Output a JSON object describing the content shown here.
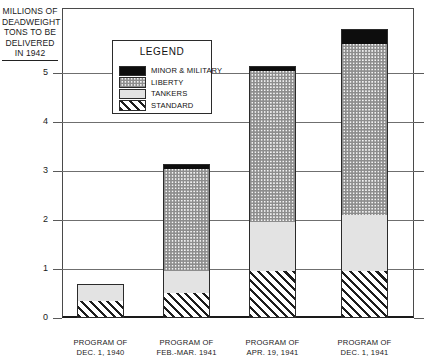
{
  "chart_data": {
    "type": "bar",
    "stacked": true,
    "title": "",
    "subtitle": "",
    "ylabel": "MILLIONS OF DEADWEIGHT TONS TO BE DELIVERED IN 1942",
    "xlabel": "",
    "ylim": [
      0,
      6.3
    ],
    "yticks": [
      0,
      1,
      2,
      3,
      4,
      5
    ],
    "ytick_labels": [
      "0",
      "1",
      "2",
      "3",
      "4",
      "5"
    ],
    "grid": true,
    "legend_position": "inside-top-center",
    "categories": [
      "PROGRAM OF DEC. 1, 1940",
      "PROGRAM OF FEB.-MAR. 1941",
      "PROGRAM OF APR. 19, 1941",
      "PROGRAM OF DEC. 1, 1941"
    ],
    "category_lines": [
      [
        "PROGRAM OF",
        "DEC. 1, 1940"
      ],
      [
        "PROGRAM OF",
        "FEB.-MAR. 1941"
      ],
      [
        "PROGRAM OF",
        "APR. 19, 1941"
      ],
      [
        "PROGRAM OF",
        "DEC. 1, 1941"
      ]
    ],
    "series": [
      {
        "name": "STANDARD",
        "pattern": "diagonal-hatch",
        "values": [
          0.35,
          0.5,
          0.95,
          0.95
        ]
      },
      {
        "name": "TANKERS",
        "pattern": "light-gray",
        "values": [
          0.35,
          0.45,
          1.0,
          1.15
        ]
      },
      {
        "name": "LIBERTY",
        "pattern": "checkerboard",
        "values": [
          0.0,
          2.1,
          3.1,
          3.5
        ]
      },
      {
        "name": "MINOR & MILITARY",
        "pattern": "solid-black",
        "values": [
          0.0,
          0.1,
          0.1,
          0.3
        ]
      }
    ],
    "totals": [
      0.7,
      3.15,
      5.15,
      5.9
    ]
  },
  "y_caption": {
    "lines": [
      "MILLIONS OF",
      "DEADWEIGHT",
      "TONS TO BE",
      "DELIVERED",
      "IN 1942"
    ]
  },
  "legend": {
    "title": "LEGEND",
    "items": [
      {
        "label": "MINOR & MILITARY",
        "key": "minor"
      },
      {
        "label": "LIBERTY",
        "key": "liberty"
      },
      {
        "label": "TANKERS",
        "key": "tankers"
      },
      {
        "label": "STANDARD",
        "key": "standard"
      }
    ]
  },
  "colors": {
    "axis": "#1a1a1a",
    "grid": "#6f6f6f",
    "minor": "#0d0d0d",
    "tankers": "#e3e3e3",
    "liberty": "#f4f4f4",
    "standard_hatch": "#1d1d1d",
    "background": "#ffffff"
  }
}
